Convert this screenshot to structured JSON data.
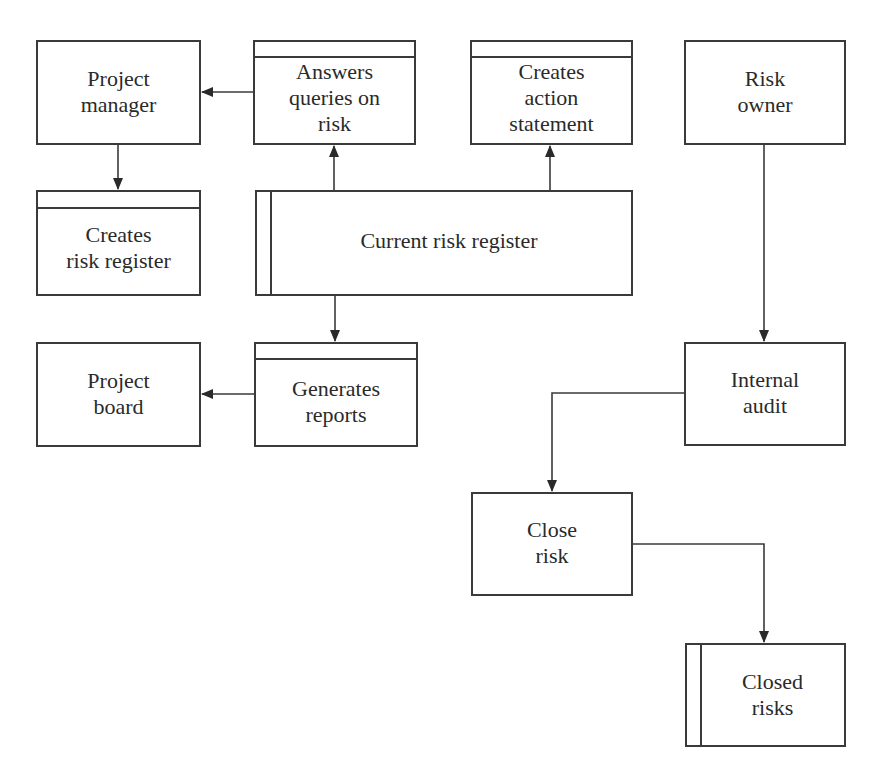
{
  "diagram": {
    "type": "flowchart",
    "nodes": [
      {
        "id": "project_manager",
        "label": "Project\nmanager",
        "shape": "rectangle"
      },
      {
        "id": "answers_queries",
        "label": "Answers\nqueries on\nrisk",
        "shape": "process-with-header"
      },
      {
        "id": "creates_action",
        "label": "Creates\naction\nstatement",
        "shape": "process-with-header"
      },
      {
        "id": "risk_owner",
        "label": "Risk\nowner",
        "shape": "rectangle"
      },
      {
        "id": "creates_register",
        "label": "Creates\nrisk register",
        "shape": "process-with-header"
      },
      {
        "id": "current_register",
        "label": "Current risk register",
        "shape": "data-store"
      },
      {
        "id": "project_board",
        "label": "Project\nboard",
        "shape": "rectangle"
      },
      {
        "id": "generates_reports",
        "label": "Generates\nreports",
        "shape": "process-with-header"
      },
      {
        "id": "internal_audit",
        "label": "Internal\naudit",
        "shape": "rectangle"
      },
      {
        "id": "close_risk",
        "label": "Close\nrisk",
        "shape": "rectangle"
      },
      {
        "id": "closed_risks",
        "label": "Closed\nrisks",
        "shape": "data-store"
      }
    ],
    "edges": [
      {
        "from": "answers_queries",
        "to": "project_manager"
      },
      {
        "from": "project_manager",
        "to": "creates_register"
      },
      {
        "from": "current_register",
        "to": "answers_queries"
      },
      {
        "from": "current_register",
        "to": "creates_action"
      },
      {
        "from": "current_register",
        "to": "generates_reports"
      },
      {
        "from": "generates_reports",
        "to": "project_board"
      },
      {
        "from": "risk_owner",
        "to": "internal_audit"
      },
      {
        "from": "internal_audit",
        "to": "close_risk"
      },
      {
        "from": "close_risk",
        "to": "closed_risks"
      }
    ]
  },
  "nodes": {
    "project_manager": "Project\nmanager",
    "answers_queries": "Answers\nqueries on\nrisk",
    "creates_action": "Creates\naction\nstatement",
    "risk_owner": "Risk\nowner",
    "creates_register": "Creates\nrisk register",
    "current_register": "Current risk register",
    "project_board": "Project\nboard",
    "generates_reports": "Generates\nreports",
    "internal_audit": "Internal\naudit",
    "close_risk": "Close\nrisk",
    "closed_risks": "Closed\nrisks"
  },
  "colors": {
    "stroke": "#3a3a3a",
    "text": "#2a2a2a",
    "background": "#ffffff"
  }
}
